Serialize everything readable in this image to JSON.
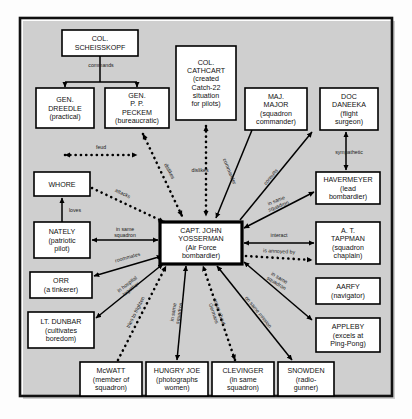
{
  "frame": {
    "x": 20,
    "y": 18,
    "width": 372,
    "height": 378,
    "border_color": "#111111"
  },
  "colors": {
    "background": "#fdfdfd",
    "box_fill": "#ffffff",
    "line": "#000000",
    "text": "#111111"
  },
  "nodes": [
    {
      "id": "scheisskopf",
      "x": 62,
      "y": 30,
      "w": 76,
      "h": 26,
      "emphasis": false,
      "lines": [
        "COL.",
        "SCHEISSKOPF"
      ]
    },
    {
      "id": "dreedle",
      "x": 36,
      "y": 88,
      "w": 58,
      "h": 40,
      "emphasis": false,
      "lines": [
        "GEN.",
        "DREEDLE",
        "(practical)"
      ]
    },
    {
      "id": "peckem",
      "x": 105,
      "y": 88,
      "w": 64,
      "h": 40,
      "emphasis": false,
      "lines": [
        "GEN.",
        "P. P.",
        "PECKEM",
        "(bureaucratic)"
      ]
    },
    {
      "id": "cathcart",
      "x": 176,
      "y": 46,
      "w": 60,
      "h": 74,
      "emphasis": false,
      "lines": [
        "COL.",
        "CATHCART",
        "(created",
        "Catch-22",
        "situation",
        "for pilots)"
      ]
    },
    {
      "id": "majmajor",
      "x": 245,
      "y": 88,
      "w": 62,
      "h": 42,
      "emphasis": false,
      "lines": [
        "MAJ.",
        "MAJOR",
        "(squadron",
        "commander)"
      ]
    },
    {
      "id": "daneeka",
      "x": 320,
      "y": 88,
      "w": 58,
      "h": 42,
      "emphasis": false,
      "lines": [
        "DOC",
        "DANEEKA",
        "(flight",
        "surgeon)"
      ]
    },
    {
      "id": "havermeyer",
      "x": 316,
      "y": 172,
      "w": 64,
      "h": 32,
      "emphasis": false,
      "lines": [
        "HAVERMEYER",
        "(lead",
        "bombardier)"
      ]
    },
    {
      "id": "tappman",
      "x": 316,
      "y": 222,
      "w": 64,
      "h": 42,
      "emphasis": false,
      "lines": [
        "A. T.",
        "TAPPMAN",
        "(squadron",
        "chaplain)"
      ]
    },
    {
      "id": "aarfy",
      "x": 316,
      "y": 278,
      "w": 64,
      "h": 26,
      "emphasis": false,
      "lines": [
        "AARFY",
        "(navigator)"
      ]
    },
    {
      "id": "appleby",
      "x": 316,
      "y": 318,
      "w": 64,
      "h": 34,
      "emphasis": false,
      "lines": [
        "APPLEBY",
        "(excels at",
        "Ping-Pong)"
      ]
    },
    {
      "id": "whore",
      "x": 34,
      "y": 172,
      "w": 56,
      "h": 24,
      "emphasis": false,
      "lines": [
        "WHORE"
      ]
    },
    {
      "id": "nately",
      "x": 34,
      "y": 222,
      "w": 56,
      "h": 36,
      "emphasis": false,
      "lines": [
        "NATELY",
        "(patriotic",
        "pilot)"
      ]
    },
    {
      "id": "orr",
      "x": 30,
      "y": 272,
      "w": 62,
      "h": 26,
      "emphasis": false,
      "lines": [
        "ORR",
        "(a tinkerer)"
      ]
    },
    {
      "id": "dunbar",
      "x": 28,
      "y": 312,
      "w": 66,
      "h": 36,
      "emphasis": false,
      "lines": [
        "LT. DUNBAR",
        "(cultivates",
        "boredom)"
      ]
    },
    {
      "id": "mcwatt",
      "x": 80,
      "y": 362,
      "w": 62,
      "h": 34,
      "emphasis": false,
      "lines": [
        "McWATT",
        "(member of",
        "squadron)"
      ]
    },
    {
      "id": "hungryjoe",
      "x": 146,
      "y": 362,
      "w": 62,
      "h": 34,
      "emphasis": false,
      "lines": [
        "HUNGRY JOE",
        "(photographs",
        "women)"
      ]
    },
    {
      "id": "clevinger",
      "x": 212,
      "y": 362,
      "w": 62,
      "h": 34,
      "emphasis": false,
      "lines": [
        "CLEVINGER",
        "(in same",
        "squadron)"
      ]
    },
    {
      "id": "snowden",
      "x": 278,
      "y": 362,
      "w": 56,
      "h": 34,
      "emphasis": false,
      "lines": [
        "SNOWDEN",
        "(radio-",
        "gunner)"
      ]
    },
    {
      "id": "yossarian",
      "x": 160,
      "y": 222,
      "w": 82,
      "h": 42,
      "emphasis": true,
      "lines": [
        "CAPT. JOHN",
        "YOSSERMAN",
        "(Air Force",
        "bombardier)"
      ]
    }
  ],
  "tree_edge": {
    "label": "commands",
    "from": "scheisskopf",
    "to": [
      "dreedle",
      "peckem"
    ]
  },
  "edges": [
    {
      "id": "feud",
      "label": "feud",
      "style": "dotted",
      "arrows": "both",
      "x1": 65,
      "y1": 155,
      "x2": 137,
      "y2": 155,
      "lx": 101,
      "ly": 149,
      "rot": 0
    },
    {
      "id": "peckem-dislikes-yoss",
      "label": "dislikes",
      "style": "dotted",
      "arrows": "both",
      "x1": 143,
      "y1": 134,
      "x2": 182,
      "y2": 216,
      "lx": 168,
      "ly": 172,
      "rot": 62
    },
    {
      "id": "cathcart-dislikes",
      "label": "dislikes",
      "style": "dotted",
      "arrows": "both",
      "x1": 206,
      "y1": 126,
      "x2": 206,
      "y2": 216,
      "lx": 200,
      "ly": 172,
      "rot": 0
    },
    {
      "id": "whore-attacks",
      "label": "attacks",
      "style": "dotted",
      "arrows": "one",
      "x1": 92,
      "y1": 188,
      "x2": 164,
      "y2": 222,
      "lx": 122,
      "ly": 195,
      "rot": 25
    },
    {
      "id": "loves",
      "label": "loves",
      "style": "solid",
      "arrows": "one",
      "x1": 62,
      "y1": 222,
      "x2": 62,
      "y2": 198,
      "lx": 75,
      "ly": 212,
      "rot": 0
    },
    {
      "id": "nately-squadron",
      "label": "in same\nsquadron",
      "style": "solid",
      "arrows": "both",
      "x1": 92,
      "y1": 240,
      "x2": 158,
      "y2": 240,
      "lx": 125,
      "ly": 234,
      "rot": 0
    },
    {
      "id": "orr-roommates",
      "label": "roommates",
      "style": "solid",
      "arrows": "both",
      "x1": 94,
      "y1": 276,
      "x2": 162,
      "y2": 256,
      "lx": 128,
      "ly": 259,
      "rot": -16
    },
    {
      "id": "dunbar-hospital",
      "label": "in hospital\ntogether",
      "style": "solid",
      "arrows": "both",
      "x1": 96,
      "y1": 318,
      "x2": 163,
      "y2": 264,
      "lx": 130,
      "ly": 288,
      "rot": -38
    },
    {
      "id": "mcwatt-frighten",
      "label": "tries to frighten",
      "style": "dotted",
      "arrows": "one",
      "x1": 118,
      "y1": 360,
      "x2": 166,
      "y2": 266,
      "lx": 137,
      "ly": 313,
      "rot": -63
    },
    {
      "id": "hungryjoe-squadron",
      "label": "in same\nsquadron",
      "style": "solid",
      "arrows": "both",
      "x1": 177,
      "y1": 360,
      "x2": 186,
      "y2": 266,
      "lx": 178,
      "ly": 313,
      "rot": -80
    },
    {
      "id": "clevinger-argue",
      "label": "argue about\nGermans",
      "style": "dotted",
      "arrows": "both",
      "x1": 235,
      "y1": 360,
      "x2": 203,
      "y2": 266,
      "lx": 215,
      "ly": 313,
      "rot": 71
    },
    {
      "id": "snowden-mission",
      "label": "on same mission",
      "style": "solid",
      "arrows": "both",
      "x1": 292,
      "y1": 360,
      "x2": 217,
      "y2": 266,
      "lx": 257,
      "ly": 313,
      "rot": 51
    },
    {
      "id": "majmajor-commander",
      "label": "commander",
      "style": "solid",
      "arrows": "one",
      "x1": 252,
      "y1": 130,
      "x2": 216,
      "y2": 218,
      "lx": 228,
      "ly": 172,
      "rot": 68
    },
    {
      "id": "daneeka-consults",
      "label": "consults",
      "style": "solid",
      "arrows": "one",
      "x1": 240,
      "y1": 220,
      "x2": 312,
      "y2": 132,
      "lx": 272,
      "ly": 178,
      "rot": -50
    },
    {
      "id": "daneeka-sympathetic",
      "label": "sympathetic",
      "style": "solid",
      "arrows": "both",
      "x1": 346,
      "y1": 132,
      "x2": 346,
      "y2": 170,
      "lx": 349,
      "ly": 154,
      "rot": 0
    },
    {
      "id": "havermeyer-squadron",
      "label": "in same\nsquadron",
      "style": "solid",
      "arrows": "both",
      "x1": 244,
      "y1": 228,
      "x2": 314,
      "y2": 192,
      "lx": 278,
      "ly": 205,
      "rot": -22
    },
    {
      "id": "tappman-interact",
      "label": "interact",
      "style": "solid",
      "arrows": "both",
      "x1": 244,
      "y1": 243,
      "x2": 314,
      "y2": 243,
      "lx": 279,
      "ly": 237,
      "rot": 0
    },
    {
      "id": "aarfy-annoyed",
      "label": "is annoyed by",
      "style": "dotted",
      "arrows": "one",
      "x1": 246,
      "y1": 256,
      "x2": 312,
      "y2": 260,
      "lx": 279,
      "ly": 253,
      "rot": 3
    },
    {
      "id": "appleby-squadron",
      "label": "in same\nsquadron",
      "style": "solid",
      "arrows": "both",
      "x1": 244,
      "y1": 262,
      "x2": 312,
      "y2": 320,
      "lx": 277,
      "ly": 282,
      "rot": 31
    }
  ]
}
